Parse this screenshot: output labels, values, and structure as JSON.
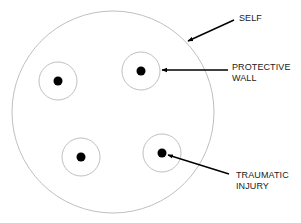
{
  "diagram": {
    "colors": {
      "outline": "#b8b8b8",
      "dot": "#000000",
      "arrow": "#000000",
      "text": "#1a1a1a"
    },
    "self_circle": {
      "cx": 113,
      "cy": 112,
      "r": 101
    },
    "inner_units": [
      {
        "cx": 58,
        "cy": 81,
        "r": 19,
        "dot_r": 4.5
      },
      {
        "cx": 141,
        "cy": 71,
        "r": 19,
        "dot_r": 4.5
      },
      {
        "cx": 81,
        "cy": 157,
        "r": 19,
        "dot_r": 4.5
      },
      {
        "cx": 162,
        "cy": 153,
        "r": 19,
        "dot_r": 4.5
      }
    ],
    "labels": {
      "self": {
        "line1": "SELF"
      },
      "protective_wall": {
        "line1": "PROTECTIVE",
        "line2": "WALL"
      },
      "traumatic_injury": {
        "line1": "TRAUMATIC",
        "line2": "INJURY"
      }
    },
    "arrows": [
      {
        "name": "self",
        "x1": 234,
        "y1": 20,
        "x2": 188,
        "y2": 41
      },
      {
        "name": "protective-wall",
        "x1": 228,
        "y1": 70,
        "x2": 162,
        "y2": 70
      },
      {
        "name": "traumatic-injury",
        "x1": 229,
        "y1": 174,
        "x2": 168,
        "y2": 155
      }
    ]
  }
}
